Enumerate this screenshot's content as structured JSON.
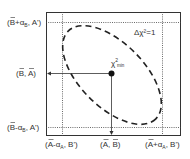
{
  "diagram": {
    "contour_label": "Δχ²=1",
    "minimum_label": {
      "base": "χ",
      "sup": "2",
      "sub": "min"
    },
    "left_labels": {
      "top": {
        "open": "(",
        "var": "B",
        "op": "+α",
        "sub": "B",
        "rest": ", A')"
      },
      "middle": {
        "text": "(B, A)"
      },
      "bottom": {
        "open": "(",
        "var": "B",
        "op": "-α",
        "sub": "B",
        "rest": ", A')"
      }
    },
    "bottom_labels": {
      "left": {
        "open": "(",
        "var": "A",
        "op": "-α",
        "sub": "A",
        "rest": ", B')"
      },
      "middle": {
        "text": "(A, B)"
      },
      "right": {
        "open": "(",
        "var": "A",
        "op": "+α",
        "sub": "A",
        "rest": ", B')"
      }
    },
    "colors": {
      "line": "#222222",
      "background": "#ffffff"
    }
  }
}
